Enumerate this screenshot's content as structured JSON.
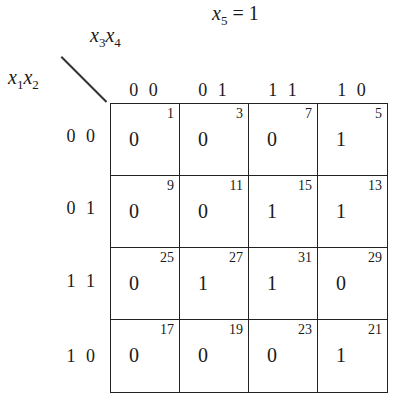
{
  "title": {
    "var": "x",
    "sub": "5",
    "rest": " = 1"
  },
  "column_variable": {
    "a": "x",
    "a_sub": "3",
    "b": "x",
    "b_sub": "4"
  },
  "row_variable": {
    "a": "x",
    "a_sub": "1",
    "b": "x",
    "b_sub": "2"
  },
  "column_headers": [
    "0 0",
    "0 1",
    "1 1",
    "1 0"
  ],
  "row_headers": [
    "0 0",
    "0 1",
    "1 1",
    "1 0"
  ],
  "cells": [
    [
      {
        "value": "0",
        "minterm": "1"
      },
      {
        "value": "0",
        "minterm": "3"
      },
      {
        "value": "0",
        "minterm": "7"
      },
      {
        "value": "1",
        "minterm": "5"
      }
    ],
    [
      {
        "value": "0",
        "minterm": "9"
      },
      {
        "value": "0",
        "minterm": "11"
      },
      {
        "value": "1",
        "minterm": "15"
      },
      {
        "value": "1",
        "minterm": "13"
      }
    ],
    [
      {
        "value": "0",
        "minterm": "25"
      },
      {
        "value": "1",
        "minterm": "27"
      },
      {
        "value": "1",
        "minterm": "31"
      },
      {
        "value": "0",
        "minterm": "29"
      }
    ],
    [
      {
        "value": "0",
        "minterm": "17"
      },
      {
        "value": "0",
        "minterm": "19"
      },
      {
        "value": "0",
        "minterm": "23"
      },
      {
        "value": "1",
        "minterm": "21"
      }
    ]
  ]
}
